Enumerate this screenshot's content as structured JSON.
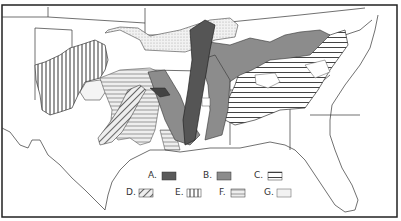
{
  "map": {
    "title": "",
    "region": "Southeastern United States",
    "legend": [
      {
        "key": "A",
        "label": "A.",
        "pattern": "solid-dark",
        "color": "#5a5a5a"
      },
      {
        "key": "B",
        "label": "B.",
        "pattern": "solid-medium",
        "color": "#8c8c8c"
      },
      {
        "key": "C",
        "label": "C.",
        "pattern": "heavy-horizontal-lines",
        "color": "#333333"
      },
      {
        "key": "D",
        "label": "D.",
        "pattern": "diagonal-lines",
        "color": "#555555"
      },
      {
        "key": "E",
        "label": "E.",
        "pattern": "vertical-lines",
        "color": "#333333"
      },
      {
        "key": "F",
        "label": "F.",
        "pattern": "light-horizontal-lines",
        "color": "#999999"
      },
      {
        "key": "G",
        "label": "G.",
        "pattern": "light-stipple",
        "color": "#eeeeee"
      }
    ]
  }
}
